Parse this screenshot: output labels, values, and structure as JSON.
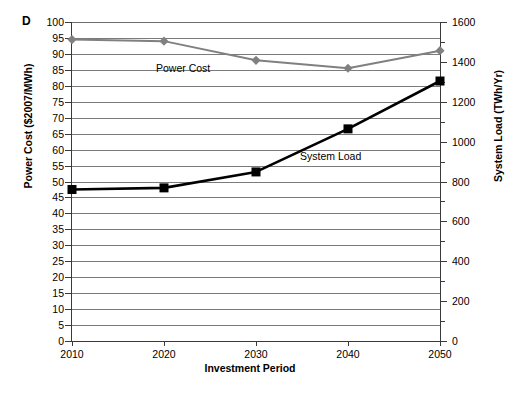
{
  "panel": {
    "label": "D"
  },
  "chart_data": {
    "type": "line",
    "title": "",
    "xlabel": "Investment Period",
    "ylabel": "Power Cost ($2007/MWh)",
    "y2label": "System Load (TWh/Yr)",
    "categories": [
      "2010",
      "2020",
      "2030",
      "2040",
      "2050"
    ],
    "x": [
      2010,
      2020,
      2030,
      2040,
      2050
    ],
    "xlim": [
      2010,
      2050
    ],
    "ylim": [
      0,
      100
    ],
    "y2lim": [
      0,
      1600
    ],
    "yticks": [
      0,
      5,
      10,
      15,
      20,
      25,
      30,
      35,
      40,
      45,
      50,
      55,
      60,
      65,
      70,
      75,
      80,
      85,
      90,
      95,
      100
    ],
    "y2ticks": [
      0,
      200,
      400,
      600,
      800,
      1000,
      1200,
      1400,
      1600
    ],
    "grid": true,
    "legend": "inline-annotations",
    "series": [
      {
        "name": "Power Cost",
        "axis": "left",
        "color": "#808080",
        "marker": "diamond",
        "values": [
          94.5,
          94.0,
          88.0,
          85.5,
          91.0
        ]
      },
      {
        "name": "System Load",
        "axis": "right",
        "color": "#000000",
        "marker": "square",
        "values": [
          760,
          768,
          848,
          1064,
          1304
        ]
      }
    ],
    "annotations": [
      {
        "text": "Power Cost",
        "series": "Power Cost"
      },
      {
        "text": "System Load",
        "series": "System Load"
      }
    ]
  }
}
